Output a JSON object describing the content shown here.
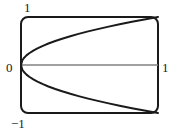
{
  "figure": {
    "type": "plot",
    "background_color": "#ffffff",
    "frame": {
      "shape": "rounded-rectangle",
      "stroke_color": "#1a1a1a",
      "corner_radius": 7,
      "left": 21,
      "top": 17,
      "right": 158,
      "bottom": 113
    },
    "labels": {
      "y_max": "1",
      "origin": "0",
      "y_min": "−1",
      "x_max": "1"
    }
  },
  "chart_data": {
    "type": "line",
    "title": "",
    "xlabel": "",
    "ylabel": "",
    "xlim": [
      0,
      1
    ],
    "ylim": [
      -1,
      1
    ],
    "grid": false,
    "legend": null,
    "xticks": [
      0,
      1
    ],
    "xticklabels": [
      "0",
      "1"
    ],
    "yticks": [
      -1,
      0,
      1
    ],
    "yticklabels": [
      "−1",
      "0",
      "1"
    ],
    "series": [
      {
        "name": "y = sqrt(x)",
        "color": "#1a1a1a",
        "linewidth": 2,
        "x": [
          0,
          0.01,
          0.02,
          0.04,
          0.06,
          0.09,
          0.12,
          0.16,
          0.2,
          0.25,
          0.3,
          0.36,
          0.42,
          0.49,
          0.56,
          0.64,
          0.72,
          0.81,
          0.9,
          1.0
        ],
        "values": [
          0,
          0.1,
          0.141,
          0.2,
          0.245,
          0.3,
          0.346,
          0.4,
          0.447,
          0.5,
          0.548,
          0.6,
          0.648,
          0.7,
          0.748,
          0.8,
          0.849,
          0.9,
          0.949,
          1.0
        ]
      },
      {
        "name": "y = -sqrt(x)",
        "color": "#1a1a1a",
        "linewidth": 2,
        "x": [
          0,
          0.01,
          0.02,
          0.04,
          0.06,
          0.09,
          0.12,
          0.16,
          0.2,
          0.25,
          0.3,
          0.36,
          0.42,
          0.49,
          0.56,
          0.64,
          0.72,
          0.81,
          0.9,
          1.0
        ],
        "values": [
          0,
          -0.1,
          -0.141,
          -0.2,
          -0.245,
          -0.3,
          -0.346,
          -0.4,
          -0.447,
          -0.5,
          -0.548,
          -0.6,
          -0.648,
          -0.7,
          -0.748,
          -0.8,
          -0.849,
          -0.9,
          -0.949,
          -1.0
        ]
      },
      {
        "name": "y = 0 axis",
        "color": "#808080",
        "linewidth": 1.5,
        "x": [
          0,
          1
        ],
        "values": [
          0,
          0
        ]
      }
    ]
  }
}
